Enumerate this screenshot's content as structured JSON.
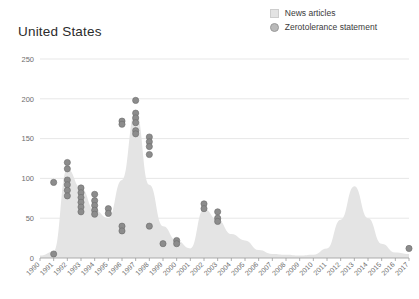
{
  "chart": {
    "title": "United States",
    "legend": [
      {
        "label": "News articles",
        "marker": "square",
        "color": "#e3e3e3"
      },
      {
        "label": "Zerotolerance statement",
        "marker": "circle",
        "color": "#b9b9b9"
      }
    ]
  },
  "chart_data": {
    "type": "area",
    "title": "United States",
    "xlabel": "",
    "ylabel": "",
    "ylim": [
      0,
      250
    ],
    "grid": true,
    "legend_position": "top-right",
    "yticks": [
      0,
      50,
      100,
      150,
      200,
      250
    ],
    "categories": [
      "1990",
      "1991",
      "1992",
      "1993",
      "1994",
      "1995",
      "1996",
      "1997",
      "1998",
      "1999",
      "2000",
      "2001",
      "2002",
      "2003",
      "2004",
      "2005",
      "2006",
      "2007",
      "2008",
      "2009",
      "2010",
      "2011",
      "2012",
      "2013",
      "2014",
      "2015",
      "2016",
      "2017"
    ],
    "series": [
      {
        "name": "News articles",
        "type": "area",
        "color": "#e4e4e4",
        "values": [
          3,
          8,
          112,
          88,
          60,
          50,
          98,
          185,
          92,
          40,
          22,
          12,
          62,
          48,
          30,
          22,
          10,
          5,
          4,
          3,
          4,
          12,
          48,
          90,
          50,
          18,
          7,
          5
        ]
      },
      {
        "name": "Zerotolerance statement",
        "type": "scatter",
        "color": "#8c8c8c",
        "points": [
          {
            "x": "1991",
            "y": 5
          },
          {
            "x": "1992",
            "y": 120
          },
          {
            "x": "1992",
            "y": 112
          },
          {
            "x": "1992",
            "y": 98
          },
          {
            "x": "1992",
            "y": 92
          },
          {
            "x": "1992",
            "y": 85
          },
          {
            "x": "1992",
            "y": 78
          },
          {
            "x": "1991",
            "y": 95
          },
          {
            "x": "1993",
            "y": 88
          },
          {
            "x": "1993",
            "y": 82
          },
          {
            "x": "1993",
            "y": 76
          },
          {
            "x": "1993",
            "y": 70
          },
          {
            "x": "1993",
            "y": 64
          },
          {
            "x": "1993",
            "y": 58
          },
          {
            "x": "1994",
            "y": 80
          },
          {
            "x": "1994",
            "y": 72
          },
          {
            "x": "1994",
            "y": 66
          },
          {
            "x": "1994",
            "y": 60
          },
          {
            "x": "1994",
            "y": 55
          },
          {
            "x": "1995",
            "y": 62
          },
          {
            "x": "1995",
            "y": 56
          },
          {
            "x": "1996",
            "y": 40
          },
          {
            "x": "1996",
            "y": 34
          },
          {
            "x": "1997",
            "y": 198
          },
          {
            "x": "1997",
            "y": 182
          },
          {
            "x": "1997",
            "y": 176
          },
          {
            "x": "1996",
            "y": 172
          },
          {
            "x": "1997",
            "y": 170
          },
          {
            "x": "1996",
            "y": 168
          },
          {
            "x": "1997",
            "y": 160
          },
          {
            "x": "1997",
            "y": 156
          },
          {
            "x": "1998",
            "y": 152
          },
          {
            "x": "1998",
            "y": 146
          },
          {
            "x": "1998",
            "y": 140
          },
          {
            "x": "1998",
            "y": 130
          },
          {
            "x": "1998",
            "y": 40
          },
          {
            "x": "1999",
            "y": 18
          },
          {
            "x": "2000",
            "y": 22
          },
          {
            "x": "2000",
            "y": 18
          },
          {
            "x": "2002",
            "y": 68
          },
          {
            "x": "2002",
            "y": 62
          },
          {
            "x": "2003",
            "y": 58
          },
          {
            "x": "2003",
            "y": 50
          },
          {
            "x": "2003",
            "y": 46
          },
          {
            "x": "2017",
            "y": 12
          }
        ]
      }
    ]
  }
}
